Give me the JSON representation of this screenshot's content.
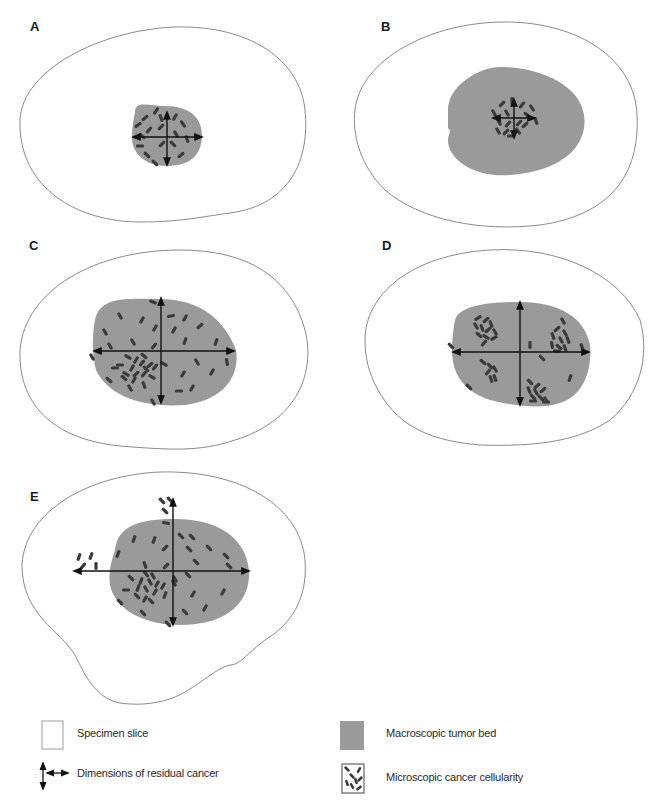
{
  "panels": [
    {
      "id": "A",
      "label": "A"
    },
    {
      "id": "B",
      "label": "B"
    },
    {
      "id": "C",
      "label": "C"
    },
    {
      "id": "D",
      "label": "D"
    },
    {
      "id": "E",
      "label": "E"
    }
  ],
  "legend": {
    "specimen_slice": "Specimen slice",
    "tumor_bed": "Macroscopic tumor bed",
    "dimensions": "Dimensions of residual cancer",
    "cellularity": "Microscopic cancer cellularity"
  },
  "colors": {
    "outline": "#8a8a8a",
    "tumor_bed": "#9a9a9a",
    "cells": "#3a3a3a",
    "arrows": "#111111"
  }
}
